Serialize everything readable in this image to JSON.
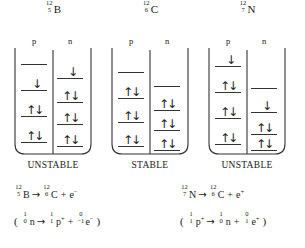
{
  "diagram": {
    "title_hidden": "Nuclear shell model energy level diagrams for A=12 isobars",
    "column_headers": {
      "proton": "p",
      "neutron": "n"
    },
    "arrow_glyphs": {
      "up": "↑",
      "down": "↓",
      "reaction": "→"
    },
    "panels": [
      {
        "id": "boron-12",
        "nuclide": {
          "mass": "12",
          "atomic": "5",
          "symbol": "B"
        },
        "stability": "UNSTABLE",
        "proton_levels": [
          {
            "index": 0,
            "occupancy": []
          },
          {
            "index": 1,
            "occupancy": [
              "down"
            ]
          },
          {
            "index": 2,
            "occupancy": [
              "up",
              "down"
            ]
          },
          {
            "index": 3,
            "occupancy": [
              "up",
              "down"
            ]
          }
        ],
        "neutron_levels": [
          {
            "index": 0,
            "occupancy": [
              "down"
            ]
          },
          {
            "index": 1,
            "occupancy": [
              "up",
              "down"
            ]
          },
          {
            "index": 2,
            "occupancy": [
              "up",
              "down"
            ]
          },
          {
            "index": 3,
            "occupancy": [
              "up",
              "down"
            ]
          }
        ]
      },
      {
        "id": "carbon-12",
        "nuclide": {
          "mass": "12",
          "atomic": "6",
          "symbol": "C"
        },
        "stability": "STABLE",
        "proton_levels": [
          {
            "index": 0,
            "occupancy": []
          },
          {
            "index": 1,
            "occupancy": [
              "up",
              "down"
            ]
          },
          {
            "index": 2,
            "occupancy": [
              "up",
              "down"
            ]
          },
          {
            "index": 3,
            "occupancy": [
              "up",
              "down"
            ]
          }
        ],
        "neutron_levels": [
          {
            "index": 0,
            "occupancy": []
          },
          {
            "index": 1,
            "occupancy": [
              "up",
              "down"
            ]
          },
          {
            "index": 2,
            "occupancy": [
              "up",
              "down"
            ]
          },
          {
            "index": 3,
            "occupancy": [
              "up",
              "down"
            ]
          }
        ]
      },
      {
        "id": "nitrogen-12",
        "nuclide": {
          "mass": "12",
          "atomic": "7",
          "symbol": "N"
        },
        "stability": "UNSTABLE",
        "proton_levels": [
          {
            "index": 0,
            "occupancy": [
              "down"
            ]
          },
          {
            "index": 1,
            "occupancy": [
              "up",
              "down"
            ]
          },
          {
            "index": 2,
            "occupancy": [
              "up",
              "down"
            ]
          },
          {
            "index": 3,
            "occupancy": [
              "up",
              "down"
            ]
          }
        ],
        "neutron_levels": [
          {
            "index": 0,
            "occupancy": []
          },
          {
            "index": 1,
            "occupancy": [
              "down"
            ]
          },
          {
            "index": 2,
            "occupancy": [
              "up",
              "down"
            ]
          },
          {
            "index": 3,
            "occupancy": [
              "up",
              "down"
            ]
          }
        ]
      }
    ]
  },
  "equations": {
    "decay_left": {
      "reactant": {
        "mass": "12",
        "atomic": "5",
        "symbol": "B"
      },
      "arrow": "→",
      "product": {
        "mass": "12",
        "atomic": "6",
        "symbol": "C"
      },
      "plus": "+",
      "emitted": "e",
      "emitted_charge": "−"
    },
    "decay_right": {
      "reactant": {
        "mass": "12",
        "atomic": "7",
        "symbol": "N"
      },
      "arrow": "→",
      "product": {
        "mass": "12",
        "atomic": "6",
        "symbol": "C"
      },
      "plus": "+",
      "emitted": "e",
      "emitted_charge": "+"
    },
    "nucleon_left": {
      "open": "(",
      "reactant": {
        "mass": "1",
        "atomic": "0",
        "symbol": "n"
      },
      "arrow": "→",
      "product": {
        "mass": "1",
        "atomic": "1",
        "symbol": "p",
        "charge": "+"
      },
      "plus": "+",
      "emitted": {
        "mass": "0",
        "atomic": "−1",
        "symbol": "e",
        "charge": "−"
      },
      "close": ")"
    },
    "nucleon_right": {
      "open": "(",
      "reactant": {
        "mass": "1",
        "atomic": "1",
        "symbol": "p",
        "charge": "+"
      },
      "arrow": "→",
      "product": {
        "mass": "1",
        "atomic": "0",
        "symbol": "n"
      },
      "plus": "+",
      "emitted": {
        "mass": "0",
        "atomic": "1",
        "symbol": "e",
        "charge": "+"
      },
      "close": ")"
    }
  },
  "style": {
    "ink": "#1a1a1a",
    "line": "#333333",
    "background": "#ffffff"
  }
}
